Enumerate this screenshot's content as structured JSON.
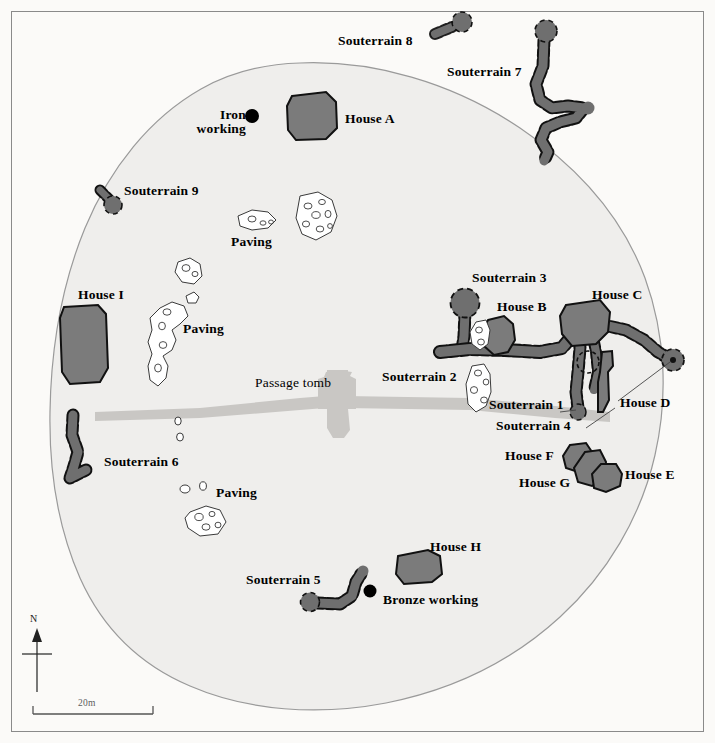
{
  "figure": {
    "kind": "archaeological-site-plan",
    "background_color": "#fbfaf8",
    "enclosure_fill": "#efeeec",
    "enclosure_stroke": "#9a9a9a",
    "structure_fill": "#7b7b7b",
    "structure_stroke": "#111111",
    "souterrain_fill": "#6f6f6f",
    "souterrain_stroke": "#111111",
    "paving_fill": "#ffffff",
    "paving_stroke": "#3a3a3a",
    "passage_tomb_fill": "#c9c7c4",
    "marker_color": "#000000",
    "frame_stroke": "#8a8a8a"
  },
  "labels": {
    "house_a": "House A",
    "house_b": "House B",
    "house_c": "House C",
    "house_d": "House D",
    "house_e": "House E",
    "house_f": "House F",
    "house_g": "House G",
    "house_h": "House H",
    "house_i": "House I",
    "souterrain_1": "Souterrain 1",
    "souterrain_2": "Souterrain 2",
    "souterrain_3": "Souterrain 3",
    "souterrain_4": "Souterrain 4",
    "souterrain_5": "Souterrain 5",
    "souterrain_6": "Souterrain 6",
    "souterrain_7": "Souterrain 7",
    "souterrain_8": "Souterrain 8",
    "souterrain_9": "Souterrain 9",
    "paving_top": "Paving",
    "paving_mid": "Paving",
    "paving_bottom": "Paving",
    "passage_tomb": "Passage tomb",
    "iron_working": "Iron\nworking",
    "bronze_working": "Bronze working"
  },
  "scale_bar": {
    "text": "20m",
    "length_px": 120
  },
  "north_arrow": {
    "text": "N"
  }
}
